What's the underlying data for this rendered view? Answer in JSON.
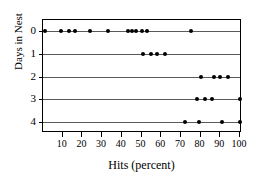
{
  "chart_data": {
    "type": "scatter",
    "title": "",
    "subtitle": "",
    "xlabel": "Hits (percent)",
    "ylabel": "Days in Nest",
    "xlim": [
      0,
      101
    ],
    "ylim": [
      -0.5,
      4.5
    ],
    "grid": false,
    "legend": null,
    "x_ticks": [
      10,
      20,
      30,
      40,
      50,
      60,
      70,
      80,
      90,
      100
    ],
    "x_tick_labels": [
      "10",
      "20",
      "30",
      "40",
      "50",
      "60",
      "70",
      "80",
      "90",
      "100"
    ],
    "y_ticks": [
      0,
      1,
      2,
      3,
      4
    ],
    "y_tick_labels": [
      "0",
      "1",
      "2",
      "3",
      "4"
    ],
    "marker": "filled-circle",
    "marker_color": "#000000",
    "baseline_color": "#5a5a5a",
    "frame_color": "#000000",
    "background_color": "#ffffff",
    "series": [
      {
        "name": "Days in Nest = 0",
        "category": "0",
        "y": 0,
        "values": [
          1,
          9,
          13,
          16,
          24,
          33,
          43,
          45,
          47,
          50,
          53,
          75
        ]
      },
      {
        "name": "Days in Nest = 1",
        "category": "1",
        "y": 1,
        "values": [
          51,
          55,
          58,
          62
        ]
      },
      {
        "name": "Days in Nest = 2",
        "category": "2",
        "y": 2,
        "values": [
          80,
          87,
          90,
          94
        ]
      },
      {
        "name": "Days in Nest = 3",
        "category": "3",
        "y": 3,
        "values": [
          78,
          82,
          86,
          100
        ]
      },
      {
        "name": "Days in Nest = 4",
        "category": "4",
        "y": 4,
        "values": [
          72,
          79,
          91,
          100
        ]
      }
    ]
  }
}
